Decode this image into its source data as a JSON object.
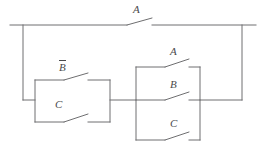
{
  "diagram": {
    "type": "switching-circuit",
    "colors": {
      "wire": "#6e6e70",
      "label": "#4a4a4c",
      "background": "#ffffff"
    },
    "top_branch": {
      "switch_label": "A",
      "switch_name": "switch-a-top"
    },
    "left_block": {
      "name": "parallel-block-left",
      "switches": [
        {
          "label": "B",
          "overbar": true,
          "name": "switch-b-not"
        },
        {
          "label": "C",
          "overbar": false,
          "name": "switch-c-left"
        }
      ]
    },
    "right_block": {
      "name": "parallel-block-right",
      "switches": [
        {
          "label": "A",
          "overbar": false,
          "name": "switch-a-right"
        },
        {
          "label": "B",
          "overbar": false,
          "name": "switch-b-right"
        },
        {
          "label": "C",
          "overbar": false,
          "name": "switch-c-right"
        }
      ]
    },
    "labels": {
      "top_a": "A",
      "left_b_not": "B",
      "left_c": "C",
      "right_a": "A",
      "right_b": "B",
      "right_c": "C"
    }
  }
}
